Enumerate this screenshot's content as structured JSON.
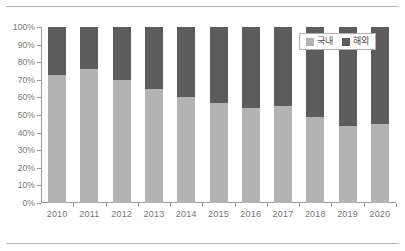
{
  "chart_data": {
    "type": "bar",
    "stacked": true,
    "normalized_percent": true,
    "title": "",
    "subtitle": "",
    "xlabel": "",
    "ylabel": "",
    "categories": [
      "2010",
      "2011",
      "2012",
      "2013",
      "2014",
      "2015",
      "2016",
      "2017",
      "2018",
      "2019",
      "2020"
    ],
    "series": [
      {
        "name": "국내",
        "color": "#b3b3b3",
        "values": [
          73,
          76,
          70,
          65,
          60,
          57,
          54,
          55,
          49,
          44,
          45
        ]
      },
      {
        "name": "해외",
        "color": "#5c5c5c",
        "values": [
          27,
          24,
          30,
          35,
          40,
          43,
          46,
          45,
          51,
          56,
          55
        ]
      }
    ],
    "ylim": [
      0,
      100
    ],
    "ytick_labels": [
      "0%",
      "10%",
      "20%",
      "30%",
      "40%",
      "50%",
      "60%",
      "70%",
      "80%",
      "90%",
      "100%"
    ],
    "ytick_values": [
      0,
      10,
      20,
      30,
      40,
      50,
      60,
      70,
      80,
      90,
      100
    ],
    "grid": false,
    "legend_position": "top-right",
    "legend_entries": [
      {
        "label": "국내",
        "swatch": "#b3b3b3"
      },
      {
        "label": "해외",
        "swatch": "#5c5c5c"
      }
    ]
  },
  "colors": {
    "domestic": "#b3b3b3",
    "overseas": "#5c5c5c",
    "axis": "#9a9a9a",
    "tick_text": "#767676",
    "rule": "#b8b8b8",
    "legend_border": "#b0b0b0",
    "background": "#ffffff"
  }
}
